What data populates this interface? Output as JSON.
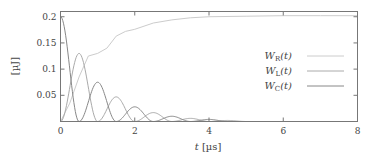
{
  "chart_data": {
    "type": "line",
    "title": "",
    "xlabel": "t [µs]",
    "ylabel": "[µJ]",
    "xlim": [
      0,
      8
    ],
    "ylim": [
      0,
      0.21
    ],
    "xticks": [
      0,
      2,
      4,
      6,
      8
    ],
    "xtick_labels": [
      "0",
      "2",
      "4",
      "6",
      "8"
    ],
    "yticks": [
      0.05,
      0.1,
      0.15,
      0.2
    ],
    "ytick_labels": [
      "0.05",
      "0.1",
      "0.15",
      "0.2"
    ],
    "grid": false,
    "legend_position": "center-right",
    "series": [
      {
        "name": "W_R(t)",
        "legend_main": "W",
        "legend_sub": "R",
        "legend_suffix": "(t)",
        "color": "#cccccc",
        "x": [
          0,
          0.25,
          0.5,
          0.75,
          1.0,
          1.25,
          1.5,
          1.75,
          2.0,
          2.5,
          3.0,
          3.5,
          4.0,
          5.0,
          6.0,
          7.0,
          8.0
        ],
        "values": [
          0,
          0.035,
          0.085,
          0.125,
          0.13,
          0.14,
          0.163,
          0.172,
          0.176,
          0.188,
          0.194,
          0.198,
          0.2,
          0.201,
          0.202,
          0.202,
          0.202
        ]
      },
      {
        "name": "W_L(t)",
        "legend_main": "W",
        "legend_sub": "L",
        "legend_suffix": "(t)",
        "color": "#aaaaaa",
        "peaks_t": [
          0.5,
          1.5,
          2.5,
          3.5,
          4.5
        ],
        "peaks_value": [
          0.13,
          0.047,
          0.017,
          0.006,
          0.002
        ]
      },
      {
        "name": "W_C(t)",
        "legend_main": "W",
        "legend_sub": "C",
        "legend_suffix": "(t)",
        "color": "#888888",
        "peaks_t": [
          0,
          1.0,
          2.0,
          3.0,
          4.0
        ],
        "peaks_value": [
          0.2,
          0.075,
          0.028,
          0.01,
          0.004
        ]
      }
    ]
  }
}
